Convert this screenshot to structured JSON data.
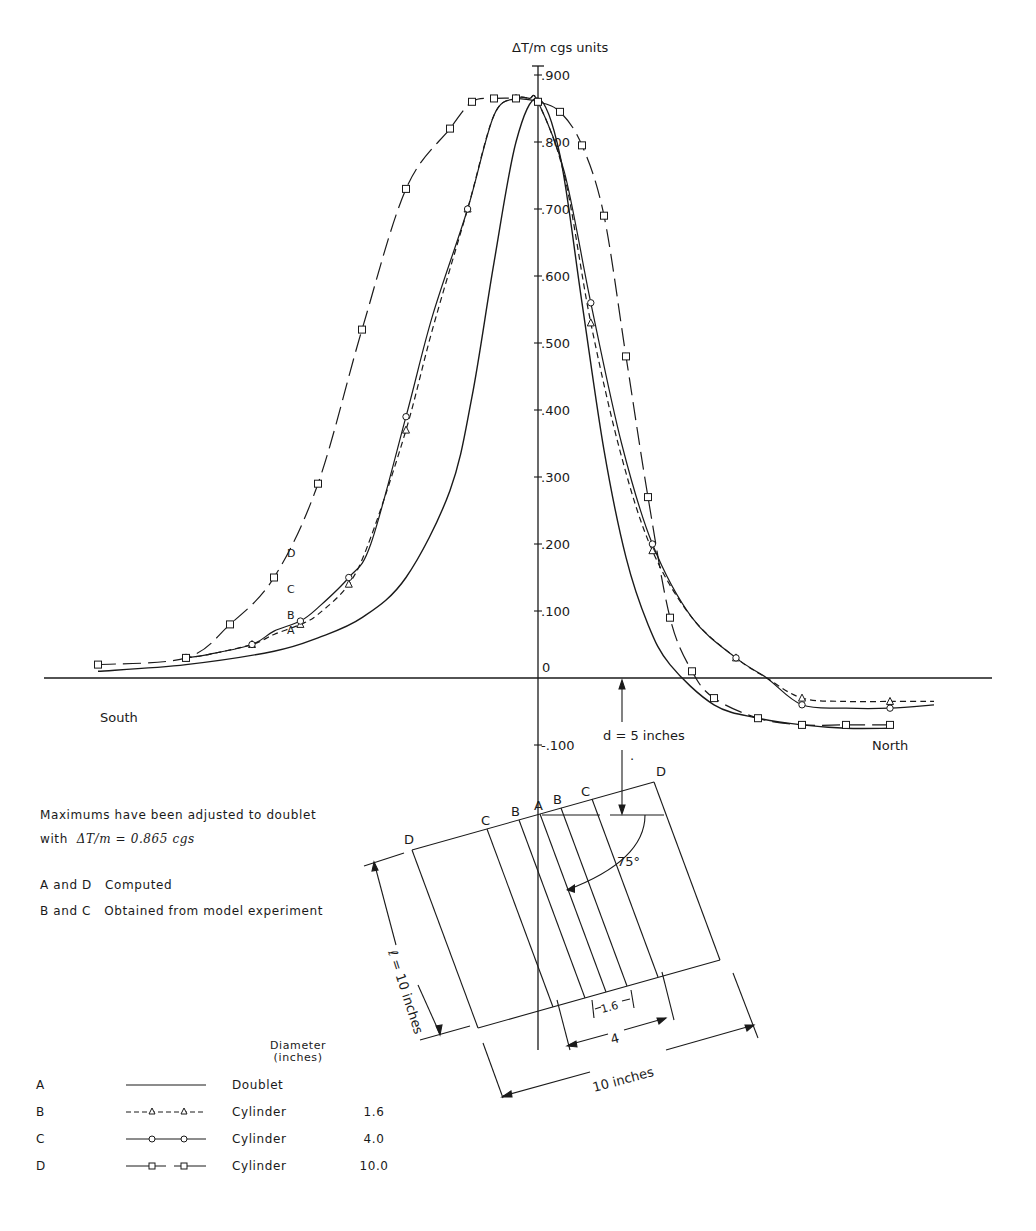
{
  "chart_data": {
    "type": "line",
    "title": "",
    "ylabel": "ΔT/m cgs units",
    "xlabel": "",
    "x_direction_labels": {
      "left": "South",
      "right": "North"
    },
    "yticks": [
      ".900",
      ".800",
      ".700",
      ".600",
      ".500",
      ".400",
      ".300",
      ".200",
      ".100",
      "0",
      "-.100"
    ],
    "ylim": [
      -0.13,
      0.92
    ],
    "xlim_relative": [
      -10,
      9
    ],
    "grid": false,
    "legend_position": "bottom-left",
    "series": [
      {
        "key": "A",
        "name": "Doublet",
        "line": "solid",
        "marker": "none",
        "diameter": "",
        "x": [
          -10,
          -8,
          -6,
          -5,
          -4,
          -3,
          -2,
          -1.5,
          -1,
          -0.5,
          0,
          0.5,
          1,
          1.5,
          2,
          2.5,
          3,
          4,
          5,
          6,
          7,
          8
        ],
        "y": [
          0.01,
          0.02,
          0.04,
          0.06,
          0.09,
          0.15,
          0.28,
          0.42,
          0.62,
          0.8,
          0.865,
          0.78,
          0.56,
          0.34,
          0.18,
          0.08,
          0.02,
          -0.04,
          -0.06,
          -0.07,
          -0.075,
          -0.075
        ]
      },
      {
        "key": "B",
        "name": "Cylinder",
        "line": "dashed",
        "marker": "triangle",
        "diameter": "1.6",
        "x": [
          -8,
          -7.5,
          -6.5,
          -6,
          -5.4,
          -5,
          -4.3,
          -3.8,
          -3,
          -2.4,
          -1.6,
          -1,
          -0.5,
          -0.2,
          0,
          0.6,
          1.2,
          1.9,
          2.6,
          3.5,
          4.5,
          5.2,
          6,
          7,
          8,
          9
        ],
        "y": [
          0.03,
          0.035,
          0.05,
          0.065,
          0.08,
          0.095,
          0.14,
          0.21,
          0.37,
          0.52,
          0.7,
          0.84,
          0.865,
          0.865,
          0.86,
          0.75,
          0.53,
          0.33,
          0.19,
          0.09,
          0.03,
          0.0,
          -0.03,
          -0.035,
          -0.035,
          -0.035
        ]
      },
      {
        "key": "C",
        "name": "Cylinder",
        "line": "solid",
        "marker": "circle",
        "diameter": "4.0",
        "x": [
          -8,
          -7.5,
          -6.5,
          -6,
          -5.4,
          -5,
          -4.3,
          -3.8,
          -3,
          -2.4,
          -1.6,
          -1,
          -0.5,
          -0.2,
          0,
          0.6,
          1.2,
          1.9,
          2.6,
          3.5,
          4.5,
          5.2,
          6,
          7,
          8,
          9
        ],
        "y": [
          0.03,
          0.035,
          0.05,
          0.07,
          0.085,
          0.105,
          0.15,
          0.2,
          0.39,
          0.54,
          0.7,
          0.84,
          0.865,
          0.865,
          0.86,
          0.755,
          0.56,
          0.35,
          0.2,
          0.09,
          0.03,
          0.0,
          -0.04,
          -0.045,
          -0.045,
          -0.04
        ]
      },
      {
        "key": "D",
        "name": "Cylinder",
        "line": "long-dash",
        "marker": "square",
        "diameter": "10.0",
        "x": [
          -10,
          -8,
          -7,
          -6,
          -5,
          -4,
          -3,
          -2,
          -1.5,
          -1,
          -0.5,
          0,
          0.5,
          1,
          1.5,
          2,
          2.5,
          3,
          3.5,
          4,
          5,
          6,
          7,
          8
        ],
        "y": [
          0.02,
          0.03,
          0.08,
          0.15,
          0.29,
          0.52,
          0.73,
          0.82,
          0.86,
          0.865,
          0.865,
          0.86,
          0.845,
          0.795,
          0.69,
          0.48,
          0.27,
          0.09,
          0.01,
          -0.03,
          -0.06,
          -0.07,
          -0.07,
          -0.07
        ]
      }
    ],
    "annotations": [
      "Maximums have been adjusted to doublet with ΔT/m = 0.865 cgs",
      "A and D Computed",
      "B and C Obtained from model experiment"
    ]
  },
  "axis": {
    "ylabel": "ΔT/m cgs units",
    "ticks": [
      {
        "label": ".900",
        "v": 0.9
      },
      {
        "label": ".800",
        "v": 0.8
      },
      {
        "label": ".700",
        "v": 0.7
      },
      {
        "label": ".600",
        "v": 0.6
      },
      {
        "label": ".500",
        "v": 0.5
      },
      {
        "label": ".400",
        "v": 0.4
      },
      {
        "label": ".300",
        "v": 0.3
      },
      {
        "label": ".200",
        "v": 0.2
      },
      {
        "label": ".100",
        "v": 0.1
      },
      {
        "label": "0",
        "v": 0
      },
      {
        "label": "-.100",
        "v": -0.1
      }
    ],
    "south": "South",
    "north": "North"
  },
  "curve_labels": {
    "A": "A",
    "B": "B",
    "C": "C",
    "D": "D"
  },
  "notes": {
    "line1": "Maximums have been adjusted to doublet",
    "line2_prefix": "with",
    "line2_formula": "ΔT/m = 0.865 cgs",
    "computed": "A and D   Computed",
    "experiment": "B and C   Obtained from model experiment"
  },
  "diagram": {
    "depth_label": "d = 5 inches",
    "angle_label": "75°",
    "length_label": "ℓ = 10 inches",
    "width_10": "10 inches",
    "width_4": "4",
    "width_16": "1.6",
    "top_labels": [
      "D",
      "C",
      "B",
      "A",
      "B",
      "C",
      "D"
    ]
  },
  "legend": {
    "header_line1": "Diameter",
    "header_line2": "(inches)",
    "rows": [
      {
        "key": "A",
        "desc": "Doublet",
        "dia": ""
      },
      {
        "key": "B",
        "desc": "Cylinder",
        "dia": "1.6"
      },
      {
        "key": "C",
        "desc": "Cylinder",
        "dia": "4.0"
      },
      {
        "key": "D",
        "desc": "Cylinder",
        "dia": "10.0"
      }
    ]
  }
}
